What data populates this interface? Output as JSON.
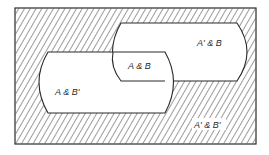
{
  "diagram": {
    "type": "venn",
    "universe_shaded": true,
    "colors": {
      "line": "#2a2a2a",
      "hatch": "#3a3a3a",
      "background": "#ffffff",
      "region_fill": "#ffffff"
    },
    "sets": [
      "A",
      "B"
    ],
    "regions": {
      "a_and_b": "A & B",
      "a_comp_and_b": "A' & B",
      "a_and_b_comp": "A & B'",
      "a_comp_and_b_comp": "A' & B'"
    }
  }
}
